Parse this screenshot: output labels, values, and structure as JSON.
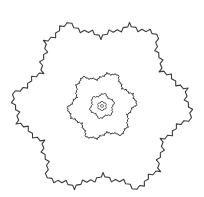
{
  "diagram": {
    "type": "nested-gosper-islands",
    "background": "#ffffff",
    "stroke": "#3a3a3a",
    "center": [
      102,
      106
    ],
    "islands": [
      {
        "name": "outer",
        "radius": 88,
        "rotation_deg": 10,
        "depth": 3,
        "stroke_width": 1.1
      },
      {
        "name": "middle",
        "radius": 34,
        "rotation_deg": 0,
        "depth": 3,
        "stroke_width": 1.0
      },
      {
        "name": "inner",
        "radius": 12.5,
        "rotation_deg": -10,
        "depth": 2,
        "stroke_width": 0.9
      },
      {
        "name": "innermost",
        "radius": 4.6,
        "rotation_deg": -20,
        "depth": 1,
        "stroke_width": 0.8
      },
      {
        "name": "core",
        "radius": 1.6,
        "rotation_deg": -30,
        "depth": 0,
        "stroke_width": 0.7
      }
    ]
  }
}
